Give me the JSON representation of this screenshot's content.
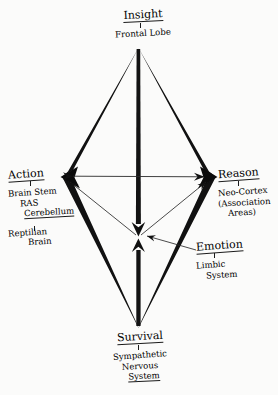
{
  "diagram": {
    "title_visible": false,
    "type": "hand-drawn concept diamond",
    "background_color": "#fbfbfa",
    "ink_color": "#1b1b1b",
    "nodes": [
      {
        "id": "insight",
        "position": "top",
        "label": "Insight",
        "sublabel_lines": [
          "Frontal Lobe"
        ],
        "vertex": {
          "x": 138,
          "y": 47
        }
      },
      {
        "id": "action",
        "position": "left",
        "label": "Action",
        "sublabel_lines": [
          "Brain Stem",
          "RAS",
          "Cerebellum"
        ],
        "sublabel_lines_2": [
          "Reptilian",
          "Brain"
        ],
        "vertex": {
          "x": 62,
          "y": 177
        }
      },
      {
        "id": "reason",
        "position": "right",
        "label": "Reason",
        "sublabel_lines": [
          "Neo-Cortex",
          "(Association",
          "Areas)"
        ],
        "vertex": {
          "x": 215,
          "y": 177
        }
      },
      {
        "id": "survival",
        "position": "bottom",
        "label": "Survival",
        "sublabel_lines": [
          "Sympathetic",
          "Nervous",
          "System"
        ],
        "vertex": {
          "x": 138,
          "y": 327
        }
      },
      {
        "id": "emotion",
        "position": "center",
        "label": "Emotion",
        "sublabel_lines": [
          "Limbic",
          "System"
        ],
        "vertex": {
          "x": 138,
          "y": 237
        }
      }
    ],
    "connectors": [
      {
        "id": "horizontal-axis",
        "from": "action",
        "to": "reason",
        "style": "thin",
        "arrows": "both"
      },
      {
        "id": "vertical-axis",
        "from": "insight",
        "to": "survival",
        "style": "thick",
        "arrows": "both-at-center"
      },
      {
        "id": "diamond-outline",
        "style": "thick",
        "arrows": "at-left-and-right-vertex"
      },
      {
        "id": "center-to-action",
        "from": "emotion",
        "to": "action",
        "style": "thin",
        "arrows": "to-action"
      },
      {
        "id": "center-to-reason",
        "from": "emotion",
        "to": "reason",
        "style": "thin",
        "arrows": "to-reason"
      },
      {
        "id": "emotion-pointer",
        "from": "emotion-label",
        "to": "emotion",
        "style": "thin",
        "arrows": "to-center"
      }
    ]
  },
  "labels": {
    "insight": {
      "main": "Insight",
      "sub": "Frontal Lobe"
    },
    "action": {
      "main": "Action",
      "sub1": "Brain Stem",
      "sub2": "RAS",
      "sub3": "Cerebellum",
      "sub4": "Reptilian",
      "sub5": "Brain"
    },
    "reason": {
      "main": "Reason",
      "sub1": "Neo-Cortex",
      "sub2": "(Association",
      "sub3": "Areas)"
    },
    "survival": {
      "main": "Survival",
      "sub1": "Sympathetic",
      "sub2": "Nervous",
      "sub3": "System"
    },
    "emotion": {
      "main": "Emotion",
      "sub1": "Limbic",
      "sub2": "System"
    }
  }
}
